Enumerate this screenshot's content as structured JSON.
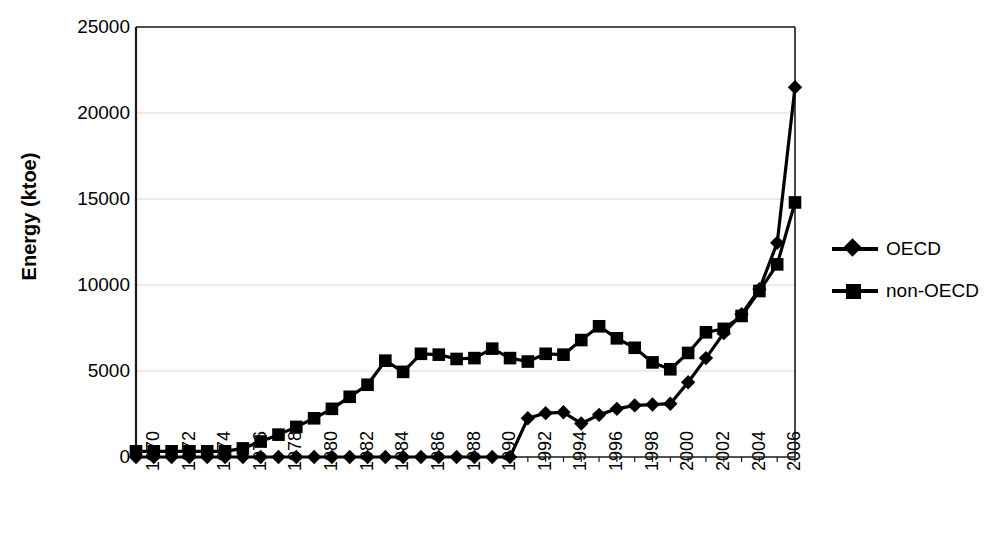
{
  "chart_data": {
    "type": "line",
    "title": "",
    "xlabel": "",
    "ylabel": "Energy (ktoe)",
    "ylim": [
      0,
      25000
    ],
    "xlim": [
      1970,
      2007
    ],
    "grid": true,
    "legend_position": "right",
    "y_ticks": [
      0,
      5000,
      10000,
      15000,
      20000,
      25000
    ],
    "y_tick_labels": [
      "0",
      "5000",
      "10000",
      "15000",
      "20000",
      "25000"
    ],
    "x_tick_labels": [
      "1970",
      "1972",
      "1974",
      "1976",
      "1978",
      "1980",
      "1982",
      "1984",
      "1986",
      "1988",
      "1990",
      "1992",
      "1994",
      "1996",
      "1998",
      "2000",
      "2002",
      "2004",
      "2006"
    ],
    "x": [
      1970,
      1971,
      1972,
      1973,
      1974,
      1975,
      1976,
      1977,
      1978,
      1979,
      1980,
      1981,
      1982,
      1983,
      1984,
      1985,
      1986,
      1987,
      1988,
      1989,
      1990,
      1991,
      1992,
      1993,
      1994,
      1995,
      1996,
      1997,
      1998,
      1999,
      2000,
      2001,
      2002,
      2003,
      2004,
      2005,
      2006,
      2007
    ],
    "series": [
      {
        "name": "OECD",
        "marker": "diamond",
        "color": "#000000",
        "values": [
          0,
          0,
          0,
          0,
          0,
          0,
          0,
          0,
          0,
          0,
          0,
          0,
          0,
          0,
          0,
          0,
          0,
          0,
          0,
          0,
          0,
          0,
          2250,
          2550,
          2600,
          1950,
          2450,
          2800,
          3000,
          3050,
          3100,
          4350,
          5750,
          7200,
          8300,
          9750,
          12450,
          21500
        ]
      },
      {
        "name": "non-OECD",
        "marker": "square",
        "color": "#000000",
        "values": [
          330,
          330,
          330,
          330,
          330,
          330,
          500,
          900,
          1300,
          1750,
          2250,
          2800,
          3500,
          4200,
          5600,
          4950,
          6000,
          5950,
          5700,
          5750,
          6300,
          5750,
          5550,
          6000,
          5950,
          6800,
          7600,
          6900,
          6350,
          5500,
          5100,
          6050,
          7250,
          7450,
          8200,
          9650,
          11200,
          14800
        ]
      }
    ]
  },
  "legend": {
    "items": [
      {
        "label": "OECD",
        "marker": "diamond"
      },
      {
        "label": "non-OECD",
        "marker": "square"
      }
    ]
  },
  "colors": {
    "axis": "#1a1a1a",
    "grid": "#d9d9d9",
    "series": "#000000",
    "background": "#ffffff"
  }
}
